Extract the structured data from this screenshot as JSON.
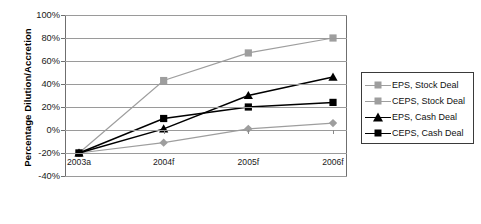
{
  "chart_data": {
    "type": "line",
    "title": "",
    "xlabel": "",
    "ylabel": "Percentage Dilution/Accretion",
    "categories": [
      "2003a",
      "2004f",
      "2005f",
      "2006f"
    ],
    "ylim": [
      -40,
      100
    ],
    "ytick_labels": [
      "100%",
      "80%",
      "60%",
      "40%",
      "20%",
      "0%",
      "-20%",
      "-40%"
    ],
    "ytick_values": [
      100,
      80,
      60,
      40,
      20,
      0,
      -20,
      -40
    ],
    "grid": true,
    "legend_position": "right",
    "series": [
      {
        "name": "EPS, Stock Deal",
        "values": [
          -20,
          -11,
          1,
          6
        ],
        "color": "#9e9e9e",
        "marker": "diamond"
      },
      {
        "name": "CEPS, Stock Deal",
        "values": [
          -20,
          43,
          67,
          80
        ],
        "color": "#9e9e9e",
        "marker": "square"
      },
      {
        "name": "EPS, Cash Deal",
        "values": [
          -20,
          1,
          30,
          46
        ],
        "color": "#000000",
        "marker": "triangle"
      },
      {
        "name": "CEPS, Cash Deal",
        "values": [
          -20,
          10,
          20,
          24
        ],
        "color": "#000000",
        "marker": "square"
      }
    ]
  }
}
